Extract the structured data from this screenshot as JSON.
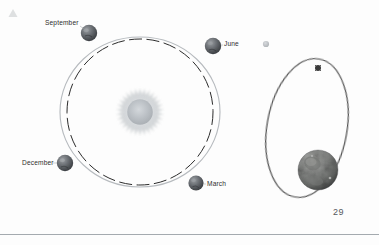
{
  "page": {
    "number": "29",
    "background_color": "#fdfdfd"
  },
  "diagram": {
    "title_marker": "corner-mark",
    "sun": {
      "name": "Sun",
      "center": [
        140,
        112
      ],
      "core_radius": 13,
      "corona_radius": 23,
      "core_color": "#b9bec4",
      "corona_color": "#cdd1d5"
    },
    "orbit_outer": {
      "name": "Earth orbit path",
      "style": "solid",
      "color": "#b5b9bd",
      "center": [
        140,
        112
      ],
      "rx": 80,
      "ry": 75
    },
    "orbit_dashed": {
      "name": "Reference circle",
      "style": "dashed",
      "color": "#2b2b2b",
      "center": [
        140,
        112
      ],
      "radius": 73
    },
    "planets": [
      {
        "label": "September",
        "cx": 89,
        "cy": 33,
        "r": 8.2,
        "color": "#6b6f74"
      },
      {
        "label": "June",
        "cx": 213,
        "cy": 46,
        "r": 8.2,
        "color": "#5f6368"
      },
      {
        "label": "December",
        "cx": 65,
        "cy": 163,
        "r": 8.2,
        "color": "#6b6f74"
      },
      {
        "label": "March",
        "cx": 196,
        "cy": 183,
        "r": 7.6,
        "color": "#5f6368"
      }
    ],
    "inset": {
      "name": "Earth and Moon detail",
      "earth": {
        "label": "Earth",
        "cx": 318,
        "cy": 170,
        "r": 20,
        "color": "#8d8f8e"
      },
      "moon": {
        "label": "Moon",
        "cx": 318,
        "cy": 68,
        "r": 3.2,
        "color": "#3c3c3c"
      },
      "moon_orbit": {
        "style": "solid",
        "color": "#4a4a4a",
        "cx": 307,
        "cy": 128,
        "rx": 40,
        "ry": 70,
        "rotation_deg": 10
      },
      "small_dot": {
        "label": "distant body",
        "cx": 266,
        "cy": 44,
        "r": 3.1,
        "color": "#b9bcbf"
      }
    },
    "footer_rule": {
      "color": "#9aa0a6",
      "y": 234
    }
  }
}
